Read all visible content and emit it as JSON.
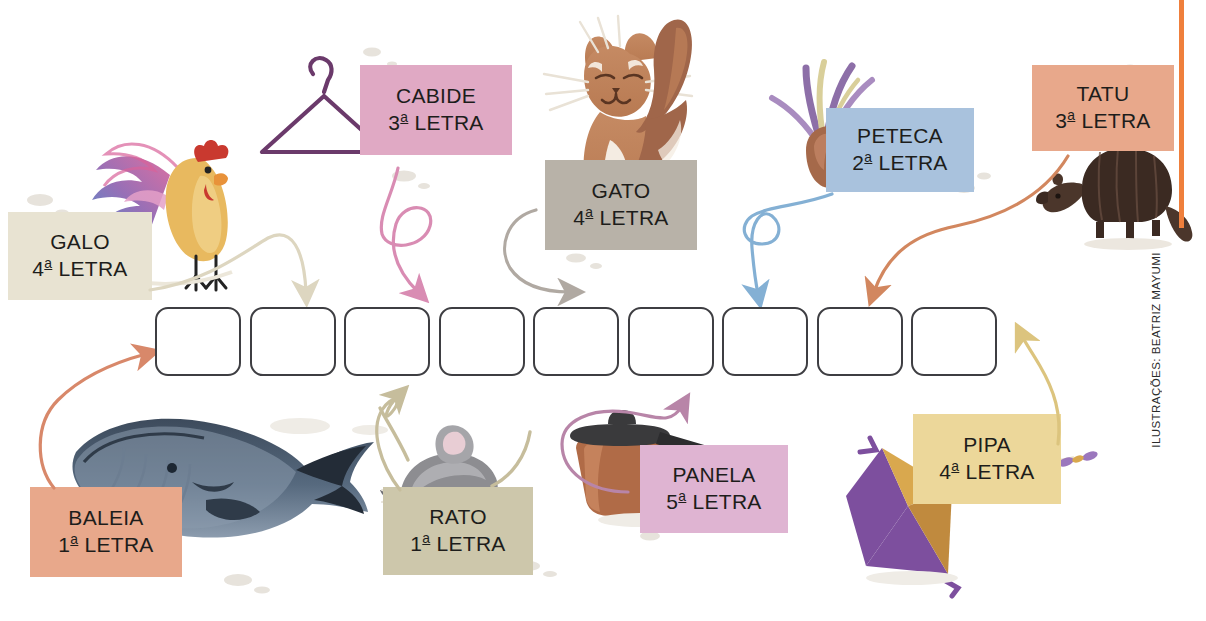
{
  "page": {
    "credit": "ILUSTRAÇÕES: BEATRIZ MAYUMI",
    "accent_rule_color": "#ef7f3c",
    "background": "#ffffff",
    "answer_box_count": 9,
    "answer_box_border": "#3e3e42",
    "answer_boxes": [
      "",
      "",
      "",
      "",
      "",
      "",
      "",
      "",
      ""
    ]
  },
  "clues": [
    {
      "id": "galo",
      "word": "GALO",
      "ordinal": "4",
      "letter_label": "LETRA",
      "ordinal_suffix": "a",
      "box_color": "#e8e3d2",
      "arrow_color": "#ddd6c0",
      "illustration": "rooster"
    },
    {
      "id": "cabide",
      "word": "CABIDE",
      "ordinal": "3",
      "letter_label": "LETRA",
      "ordinal_suffix": "a",
      "box_color": "#e0a9c4",
      "arrow_color": "#d98cb3",
      "illustration": "hanger"
    },
    {
      "id": "gato",
      "word": "GATO",
      "ordinal": "4",
      "letter_label": "LETRA",
      "ordinal_suffix": "a",
      "box_color": "#b8b2a8",
      "arrow_color": "#b0a9a2",
      "illustration": "cat"
    },
    {
      "id": "peteca",
      "word": "PETECA",
      "ordinal": "2",
      "letter_label": "LETRA",
      "ordinal_suffix": "a",
      "box_color": "#a9c2dd",
      "arrow_color": "#84b0d4",
      "illustration": "shuttlecock"
    },
    {
      "id": "tatu",
      "word": "TATU",
      "ordinal": "3",
      "letter_label": "LETRA",
      "ordinal_suffix": "a",
      "box_color": "#e8a88b",
      "arrow_color": "#d2875f",
      "illustration": "armadillo"
    },
    {
      "id": "baleia",
      "word": "BALEIA",
      "ordinal": "1",
      "letter_label": "LETRA",
      "ordinal_suffix": "a",
      "box_color": "#e8a88b",
      "arrow_color": "#d8886a",
      "illustration": "whale"
    },
    {
      "id": "rato",
      "word": "RATO",
      "ordinal": "1",
      "letter_label": "LETRA",
      "ordinal_suffix": "a",
      "box_color": "#cdc7ab",
      "arrow_color": "#c6bd9c",
      "illustration": "mouse"
    },
    {
      "id": "panela",
      "word": "PANELA",
      "ordinal": "5",
      "letter_label": "LETRA",
      "ordinal_suffix": "a",
      "box_color": "#dfb4d2",
      "arrow_color": "#b885a8",
      "illustration": "pot"
    },
    {
      "id": "pipa",
      "word": "PIPA",
      "ordinal": "4",
      "letter_label": "LETRA",
      "ordinal_suffix": "a",
      "box_color": "#ecd79a",
      "arrow_color": "#dcc47e",
      "illustration": "kite"
    }
  ]
}
